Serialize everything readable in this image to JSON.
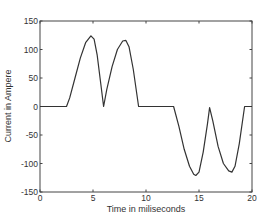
{
  "chart_data": {
    "type": "line",
    "title": "",
    "xlabel": "Time in miliseconds",
    "ylabel": "Current in Ampere",
    "xlim": [
      0,
      20
    ],
    "ylim": [
      -150,
      150
    ],
    "xticks": [
      0,
      5,
      10,
      15,
      20
    ],
    "yticks": [
      150,
      100,
      50,
      0,
      -50,
      -100,
      -150
    ],
    "grid": false,
    "legend": null,
    "series": [
      {
        "name": "current",
        "color": "#333333",
        "x": [
          0,
          2.5,
          2.8,
          3.3,
          3.8,
          4.3,
          4.8,
          5.1,
          5.4,
          5.7,
          6.0,
          6.3,
          6.8,
          7.3,
          7.8,
          8.1,
          8.4,
          8.8,
          9.3,
          9.6,
          12.6,
          13.1,
          13.6,
          14.1,
          14.5,
          14.7,
          15.0,
          15.4,
          15.8,
          16.0,
          16.3,
          16.8,
          17.3,
          17.8,
          18.1,
          18.4,
          18.8,
          19.3,
          20.0
        ],
        "y": [
          0,
          0,
          15,
          50,
          85,
          112,
          124,
          118,
          90,
          45,
          0,
          30,
          70,
          100,
          115,
          116,
          105,
          65,
          0,
          0,
          0,
          -35,
          -75,
          -105,
          -119,
          -121,
          -115,
          -80,
          -30,
          -2,
          -25,
          -70,
          -100,
          -113,
          -115,
          -105,
          -65,
          0,
          0
        ]
      }
    ]
  }
}
